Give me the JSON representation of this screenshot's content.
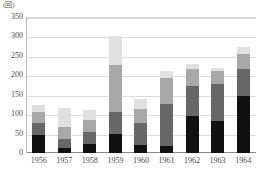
{
  "chart_data": {
    "type": "bar",
    "stacked": true,
    "title": "",
    "subtitle": "",
    "unit_label": "(回)",
    "xlabel": "",
    "ylabel": "",
    "ylim": [
      0,
      350
    ],
    "ytick_step": 50,
    "ytick_labels": [
      "350",
      "300",
      "250",
      "200",
      "150",
      "100",
      "50",
      "0"
    ],
    "ytick_values": [
      350,
      300,
      250,
      200,
      150,
      100,
      50,
      0
    ],
    "grid": true,
    "legend": "none",
    "categories": [
      "1956",
      "1957",
      "1958",
      "1959",
      "1960",
      "1961",
      "1962",
      "1963",
      "1964"
    ],
    "series": [
      {
        "name": "segment-1",
        "color": "#111111",
        "values": [
          47,
          12,
          22,
          48,
          20,
          17,
          95,
          82,
          147
        ]
      },
      {
        "name": "segment-2",
        "color": "#676767",
        "values": [
          30,
          23,
          33,
          58,
          58,
          110,
          78,
          95,
          70
        ]
      },
      {
        "name": "segment-3",
        "color": "#a8a8a8",
        "values": [
          28,
          33,
          30,
          120,
          35,
          65,
          42,
          33,
          38
        ]
      },
      {
        "name": "segment-4",
        "color": "#e0e0e0",
        "values": [
          18,
          47,
          25,
          74,
          25,
          18,
          13,
          10,
          17
        ]
      }
    ],
    "totals": [
      123,
      115,
      110,
      300,
      138,
      210,
      228,
      220,
      272
    ]
  }
}
